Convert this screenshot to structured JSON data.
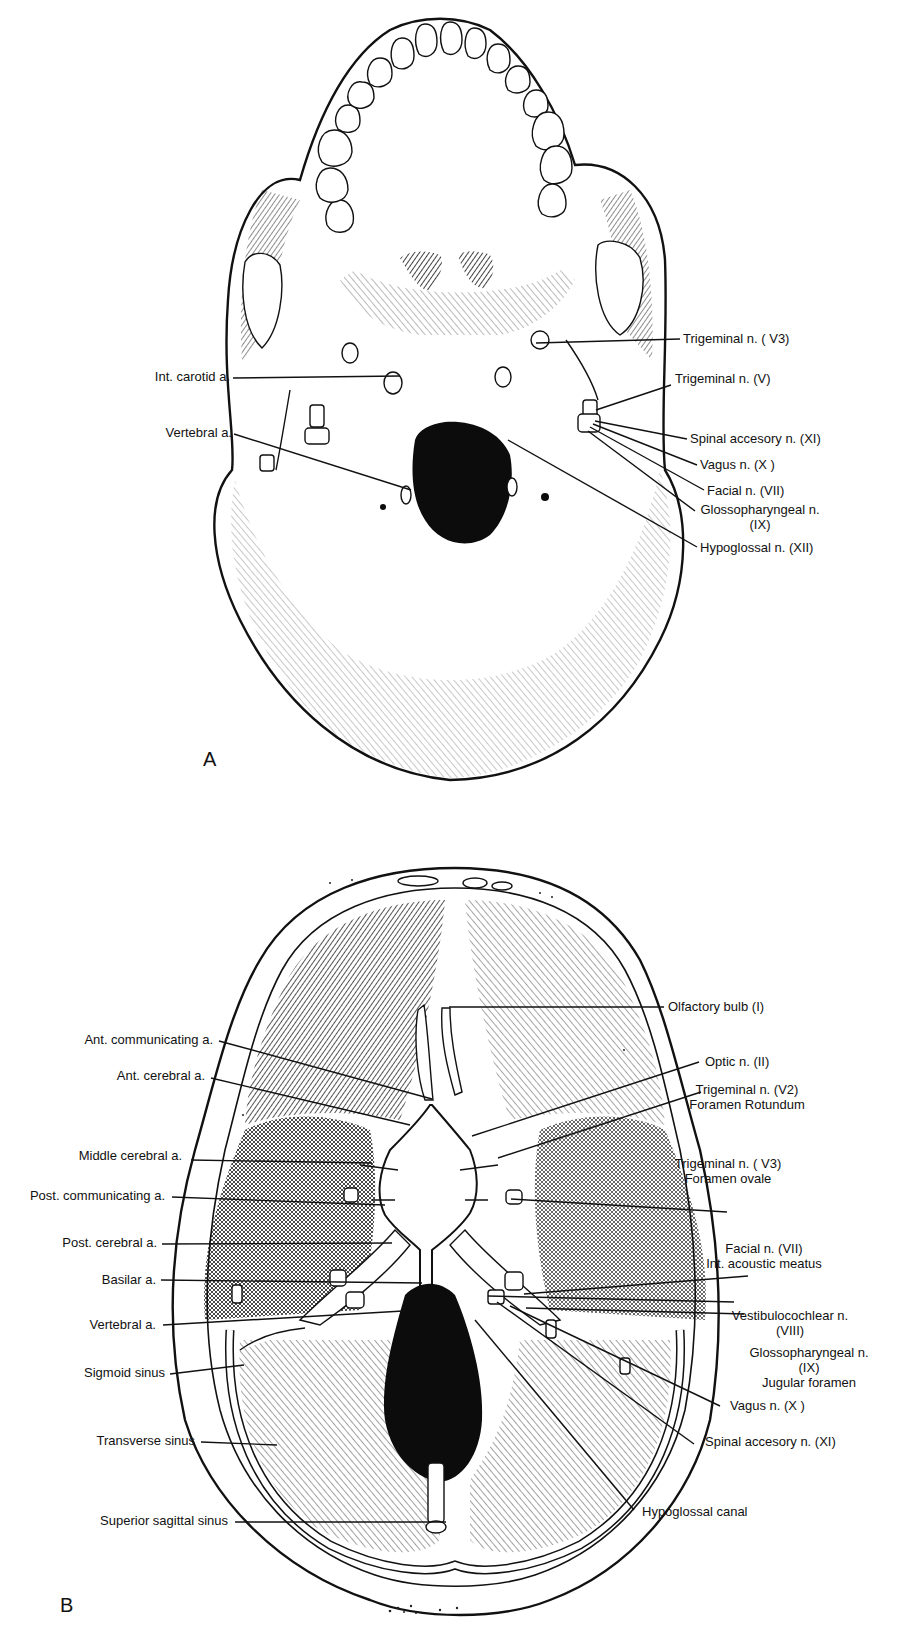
{
  "figure": {
    "panels": [
      {
        "id": "A",
        "letter": "A",
        "letter_pos": [
          203,
          766
        ],
        "view": "inferior view of skull base",
        "labels": [
          {
            "id": "trigeminal-v3",
            "lines": [
              "Trigeminal n. ( V3)"
            ],
            "x": 683,
            "y": 343,
            "anchor": "start",
            "line": [
              [
                536,
                343
              ],
              [
                680,
                339
              ]
            ]
          },
          {
            "id": "trigeminal-v",
            "lines": [
              "Trigeminal n. (V)"
            ],
            "x": 675,
            "y": 383,
            "anchor": "start",
            "line": [
              [
                596,
                410
              ],
              [
                671,
                385
              ]
            ]
          },
          {
            "id": "int-carotid",
            "lines": [
              "Int. carotid a."
            ],
            "x": 230,
            "y": 381,
            "anchor": "end",
            "line": [
              [
                233,
                378
              ],
              [
                400,
                376
              ]
            ]
          },
          {
            "id": "vertebral-a",
            "lines": [
              "Vertebral a."
            ],
            "x": 232,
            "y": 437,
            "anchor": "end",
            "line": [
              [
                234,
                434
              ],
              [
                411,
                490
              ]
            ]
          },
          {
            "id": "spinal-accessory",
            "lines": [
              "Spinal accesory n. (XI)"
            ],
            "x": 690,
            "y": 443,
            "anchor": "start",
            "line": [
              [
                595,
                421
              ],
              [
                687,
                439
              ]
            ]
          },
          {
            "id": "vagus",
            "lines": [
              "Vagus n. (X )"
            ],
            "x": 700,
            "y": 469,
            "anchor": "start",
            "line": [
              [
                593,
                424
              ],
              [
                697,
                465
              ]
            ]
          },
          {
            "id": "facial",
            "lines": [
              "Facial n. (VII)"
            ],
            "x": 707,
            "y": 495,
            "anchor": "start",
            "line": [
              [
                590,
                427
              ],
              [
                704,
                490
              ]
            ]
          },
          {
            "id": "glossopharyngeal",
            "lines": [
              "Glossopharyngeal n.",
              "(IX)"
            ],
            "x": 760,
            "y": 514,
            "anchor": "middle",
            "line": [
              [
                588,
                431
              ],
              [
                695,
                511
              ]
            ]
          },
          {
            "id": "hypoglossal",
            "lines": [
              "Hypoglossal n. (XII)"
            ],
            "x": 700,
            "y": 552,
            "anchor": "start",
            "line": [
              [
                508,
                440
              ],
              [
                697,
                547
              ]
            ]
          }
        ]
      },
      {
        "id": "B",
        "letter": "B",
        "letter_pos": [
          60,
          1612
        ],
        "view": "superior view of cranial floor",
        "labels": [
          {
            "id": "olfactory",
            "lines": [
              "Olfactory bulb (I)"
            ],
            "x": 668,
            "y": 1011,
            "anchor": "start",
            "line": [
              [
                449,
                1007
              ],
              [
                664,
                1007
              ]
            ]
          },
          {
            "id": "ant-communicating",
            "lines": [
              "Ant. communicating a."
            ],
            "x": 213,
            "y": 1044,
            "anchor": "end",
            "line": [
              [
                219,
                1041
              ],
              [
                432,
                1099
              ]
            ]
          },
          {
            "id": "ant-cerebral",
            "lines": [
              "Ant. cerebral a."
            ],
            "x": 205,
            "y": 1080,
            "anchor": "end",
            "line": [
              [
                211,
                1078
              ],
              [
                410,
                1125
              ]
            ]
          },
          {
            "id": "optic",
            "lines": [
              "Optic n. (II)"
            ],
            "x": 705,
            "y": 1066,
            "anchor": "start",
            "line": [
              [
                472,
                1136
              ],
              [
                699,
                1062
              ]
            ]
          },
          {
            "id": "trigeminal-v2",
            "lines": [
              "Trigeminal n. (V2)",
              "Foramen Rotundum"
            ],
            "x": 747,
            "y": 1094,
            "anchor": "middle",
            "line": [
              [
                498,
                1158
              ],
              [
                701,
                1092
              ]
            ]
          },
          {
            "id": "middle-cerebral",
            "lines": [
              "Middle cerebral a."
            ],
            "x": 182,
            "y": 1160,
            "anchor": "end",
            "line": [
              [
                191,
                1160
              ],
              [
                372,
                1163
              ]
            ]
          },
          {
            "id": "post-communicating",
            "lines": [
              "Post. communicating a."
            ],
            "x": 165,
            "y": 1200,
            "anchor": "end",
            "line": [
              [
                172,
                1197
              ],
              [
                385,
                1205
              ]
            ]
          },
          {
            "id": "trigeminal-v3-b",
            "lines": [
              "Trigeminal n. ( V3)",
              "Foramen ovale"
            ],
            "x": 728,
            "y": 1168,
            "anchor": "middle",
            "line": [
              [
                511,
                1199
              ],
              [
                727,
                1212
              ]
            ]
          },
          {
            "id": "post-cerebral",
            "lines": [
              "Post. cerebral a."
            ],
            "x": 157,
            "y": 1247,
            "anchor": "end",
            "line": [
              [
                162,
                1244
              ],
              [
                392,
                1243
              ]
            ]
          },
          {
            "id": "facial-b",
            "lines": [
              "Facial n. (VII)",
              "Int. acoustic meatus"
            ],
            "x": 764,
            "y": 1253,
            "anchor": "middle",
            "line": [
              [
                524,
                1294
              ],
              [
                748,
                1276
              ]
            ]
          },
          {
            "id": "basilar",
            "lines": [
              "Basilar a."
            ],
            "x": 156,
            "y": 1284,
            "anchor": "end",
            "line": [
              [
                161,
                1280
              ],
              [
                422,
                1283
              ]
            ]
          },
          {
            "id": "vestibulocochlear",
            "lines": [
              "Vestibulocochlear n.",
              "(VIII)"
            ],
            "x": 790,
            "y": 1320,
            "anchor": "middle",
            "line": [
              [
                526,
                1308
              ],
              [
                744,
                1314
              ]
            ]
          },
          {
            "id": "vertebral-b",
            "lines": [
              "Vertebral a."
            ],
            "x": 156,
            "y": 1329,
            "anchor": "end",
            "line": [
              [
                163,
                1325
              ],
              [
                403,
                1311
              ]
            ]
          },
          {
            "id": "glossopharyngeal-b",
            "lines": [
              "Glossopharyngeal n.",
              "(IX)",
              "Jugular foramen"
            ],
            "x": 809,
            "y": 1357,
            "anchor": "middle",
            "line": [
              [
                488,
                1296
              ],
              [
                734,
                1302
              ]
            ]
          },
          {
            "id": "sigmoid",
            "lines": [
              "Sigmoid sinus"
            ],
            "x": 165,
            "y": 1377,
            "anchor": "end",
            "line": [
              [
                170,
                1374
              ],
              [
                244,
                1365
              ]
            ]
          },
          {
            "id": "vagus-b",
            "lines": [
              "Vagus n. (X )"
            ],
            "x": 730,
            "y": 1410,
            "anchor": "start",
            "line": [
              [
                510,
                1306
              ],
              [
                720,
                1406
              ]
            ]
          },
          {
            "id": "transverse",
            "lines": [
              "Transverse sinus"
            ],
            "x": 195,
            "y": 1445,
            "anchor": "end",
            "line": [
              [
                201,
                1442
              ],
              [
                277,
                1445
              ]
            ]
          },
          {
            "id": "spinal-accessory-b",
            "lines": [
              "Spinal accesory n. (XI)"
            ],
            "x": 705,
            "y": 1446,
            "anchor": "start",
            "line": [
              [
                497,
                1302
              ],
              [
                694,
                1444
              ]
            ]
          },
          {
            "id": "hypoglossal-canal",
            "lines": [
              "Hypoglossal canal"
            ],
            "x": 642,
            "y": 1516,
            "anchor": "start",
            "line": [
              [
                475,
                1320
              ],
              [
                634,
                1510
              ]
            ]
          },
          {
            "id": "superior-sagittal",
            "lines": [
              "Superior sagittal sinus"
            ],
            "x": 228,
            "y": 1525,
            "anchor": "end",
            "line": [
              [
                235,
                1522
              ],
              [
                446,
                1522
              ]
            ]
          }
        ]
      }
    ]
  },
  "caption": {
    "visible_text": "",
    "note_cropped": true
  }
}
